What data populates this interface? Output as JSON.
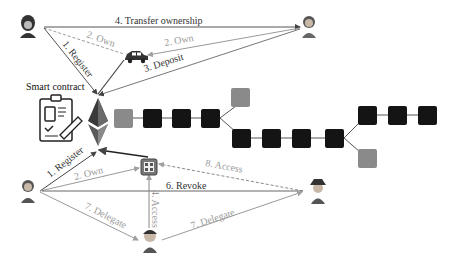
{
  "colors": {
    "dark_line": "#444444",
    "light_line": "#a8a8a8",
    "block_black": "#141414",
    "block_gray": "#8a8a8a",
    "background": "#ffffff"
  },
  "labels": {
    "smart_contract": "Smart contract",
    "transfer_ownership": "4. Transfer ownership",
    "own_dashed": "2. Own",
    "own_car": "2. Own",
    "register_top": "1. Register",
    "deposit": "3. Deposit",
    "register_bottom": "1. Register",
    "own_device": "2. Own",
    "access_dashed": "8. Access",
    "revoke": "6. Revoke",
    "delegate_left": "7. Delegate",
    "delegate_right": "7. Delegate",
    "access_vertical": "4. Access"
  },
  "icons": {
    "owner_top": "person-hooded-icon",
    "buyer_top": "person-icon",
    "car": "car-icon",
    "clipboard": "smart-contract-clipboard-icon",
    "ethereum": "ethereum-icon",
    "device": "iot-chip-icon",
    "owner_bottom": "person-icon",
    "delegate": "person-cap-icon",
    "spy": "person-hat-icon"
  },
  "blockchain": {
    "blocks": [
      {
        "x": 114,
        "y": 109,
        "type": "gray"
      },
      {
        "x": 143,
        "y": 109,
        "type": "black"
      },
      {
        "x": 172,
        "y": 109,
        "type": "black"
      },
      {
        "x": 201,
        "y": 109,
        "type": "black"
      },
      {
        "x": 231,
        "y": 88,
        "type": "gray"
      },
      {
        "x": 232,
        "y": 129,
        "type": "black"
      },
      {
        "x": 262,
        "y": 129,
        "type": "black"
      },
      {
        "x": 292,
        "y": 129,
        "type": "black"
      },
      {
        "x": 325,
        "y": 129,
        "type": "black"
      },
      {
        "x": 358,
        "y": 106,
        "type": "black"
      },
      {
        "x": 388,
        "y": 106,
        "type": "black"
      },
      {
        "x": 418,
        "y": 106,
        "type": "black"
      },
      {
        "x": 358,
        "y": 149,
        "type": "gray"
      }
    ]
  }
}
